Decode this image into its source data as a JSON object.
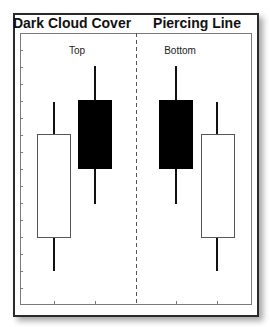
{
  "panels": [
    {
      "title": "Dark Cloud Cover",
      "position_label": "Top",
      "candles": [
        {
          "type": "bullish",
          "fill": "#ffffff",
          "body_top": 134,
          "body_bottom": 237,
          "wick_high": 102,
          "wick_low": 271
        },
        {
          "type": "bearish",
          "fill": "#000000",
          "body_top": 100,
          "body_bottom": 169,
          "wick_high": 66,
          "wick_low": 204
        }
      ]
    },
    {
      "title": "Piercing Line",
      "position_label": "Bottom",
      "candles": [
        {
          "type": "bearish",
          "fill": "#000000",
          "body_top": 100,
          "body_bottom": 169,
          "wick_high": 66,
          "wick_low": 204
        },
        {
          "type": "bullish",
          "fill": "#ffffff",
          "body_top": 134,
          "body_bottom": 237,
          "wick_high": 102,
          "wick_low": 271
        }
      ]
    }
  ],
  "colors": {
    "border": "#2a2a2a",
    "axis": "#7a7a7a",
    "divider": "#555555",
    "bearish": "#000000",
    "bullish": "#ffffff"
  }
}
